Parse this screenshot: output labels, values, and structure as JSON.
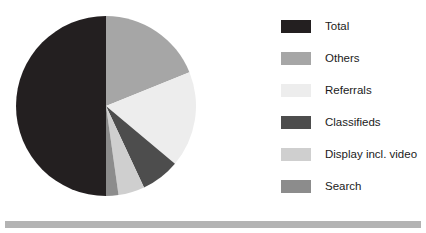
{
  "chart_data": {
    "type": "pie",
    "title": "",
    "xlabel": "",
    "ylabel": "",
    "legend_position": "right",
    "grid": false,
    "start_angle_deg": 0,
    "direction": "clockwise",
    "categories": [
      "Total",
      "Others",
      "Referrals",
      "Classifieds",
      "Display incl. video",
      "Search"
    ],
    "values": [
      50,
      19,
      17,
      7,
      5,
      2
    ],
    "units": "percent",
    "colors": [
      "#231f20",
      "#a6a6a6",
      "#ededed",
      "#4d4d4d",
      "#cfcfcf",
      "#8c8c8c"
    ],
    "slices": [
      {
        "label": "Others",
        "value": 19,
        "color": "#a6a6a6",
        "start_deg": 0,
        "end_deg": 68
      },
      {
        "label": "Referrals",
        "value": 17,
        "color": "#ededed",
        "start_deg": 68,
        "end_deg": 130
      },
      {
        "label": "Classifieds",
        "value": 7,
        "color": "#4d4d4d",
        "start_deg": 130,
        "end_deg": 155
      },
      {
        "label": "Display incl. video",
        "value": 5,
        "color": "#cfcfcf",
        "start_deg": 155,
        "end_deg": 172
      },
      {
        "label": "Search",
        "value": 2,
        "color": "#8c8c8c",
        "start_deg": 172,
        "end_deg": 180
      },
      {
        "label": "Total",
        "value": 50,
        "color": "#231f20",
        "start_deg": 180,
        "end_deg": 360
      }
    ]
  },
  "legend": {
    "items": [
      {
        "label": "Total",
        "color": "#231f20"
      },
      {
        "label": "Others",
        "color": "#a6a6a6"
      },
      {
        "label": "Referrals",
        "color": "#ededed"
      },
      {
        "label": "Classifieds",
        "color": "#4d4d4d"
      },
      {
        "label": "Display incl. video",
        "color": "#cfcfcf"
      },
      {
        "label": "Search",
        "color": "#8c8c8c"
      }
    ]
  },
  "footer": {
    "bar_color": "#b3b3b3"
  }
}
